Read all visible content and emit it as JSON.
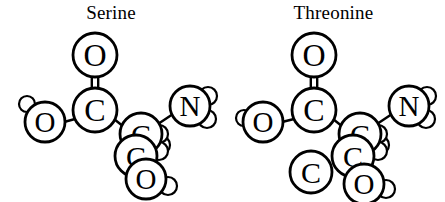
{
  "figure": {
    "background_color": "#ffffff",
    "stroke_color": "#000000",
    "fill_color": "#ffffff",
    "width": 445,
    "height": 202
  },
  "molecules": [
    {
      "id": "serine",
      "title": "Serine",
      "atoms": [
        {
          "name": "carbonyl-oxygen",
          "label": "O",
          "cx": 95,
          "cy": 55,
          "r": 22,
          "size": "large"
        },
        {
          "name": "carboxyl-carbon",
          "label": "C",
          "cx": 95,
          "cy": 110,
          "r": 22,
          "size": "large"
        },
        {
          "name": "hydroxyl-oxygen",
          "label": "O",
          "cx": 45,
          "cy": 122,
          "r": 20,
          "size": "large"
        },
        {
          "name": "hydroxyl-hydrogen",
          "label": "",
          "cx": 27,
          "cy": 104,
          "r": 8,
          "size": "small"
        },
        {
          "name": "alpha-carbon",
          "label": "C",
          "cx": 141,
          "cy": 134,
          "r": 21,
          "size": "large"
        },
        {
          "name": "alpha-hydrogen",
          "label": "",
          "cx": 161,
          "cy": 145,
          "r": 9,
          "size": "small"
        },
        {
          "name": "amine-nitrogen",
          "label": "N",
          "cx": 190,
          "cy": 106,
          "r": 20,
          "size": "large"
        },
        {
          "name": "amine-hydrogen-upper",
          "label": "",
          "cx": 208,
          "cy": 96,
          "r": 9,
          "size": "small"
        },
        {
          "name": "amine-hydrogen-lower",
          "label": "",
          "cx": 207,
          "cy": 119,
          "r": 9,
          "size": "small"
        },
        {
          "name": "beta-carbon",
          "label": "C",
          "cx": 136,
          "cy": 156,
          "r": 21,
          "size": "large"
        },
        {
          "name": "beta-hydrogen-upper",
          "label": "",
          "cx": 159,
          "cy": 134,
          "r": 9,
          "size": "small"
        },
        {
          "name": "beta-hydrogen-lower",
          "label": "",
          "cx": 159,
          "cy": 151,
          "r": 9,
          "size": "small"
        },
        {
          "name": "side-hydroxyl-oxygen",
          "label": "O",
          "cx": 146,
          "cy": 179,
          "r": 20,
          "size": "large"
        },
        {
          "name": "side-hydroxyl-hydrogen",
          "label": "",
          "cx": 168,
          "cy": 186,
          "r": 9,
          "size": "small"
        }
      ],
      "bonds": [
        {
          "name": "carbonyl-double-bond",
          "type": "double",
          "x1": 95,
          "y1": 77,
          "x2": 95,
          "y2": 88
        },
        {
          "name": "carboxyl-hydroxyl-bond",
          "type": "single",
          "x1": 75,
          "y1": 119,
          "x2": 64,
          "y2": 122
        },
        {
          "name": "carboxyl-alpha-bond",
          "type": "single",
          "x1": 114,
          "y1": 119,
          "x2": 124,
          "y2": 127
        },
        {
          "name": "alpha-amine-bond",
          "type": "single",
          "x1": 158,
          "y1": 124,
          "x2": 173,
          "y2": 114
        }
      ]
    },
    {
      "id": "threonine",
      "title": "Threonine",
      "atoms": [
        {
          "name": "carbonyl-oxygen",
          "label": "O",
          "cx": 92,
          "cy": 55,
          "r": 22,
          "size": "large"
        },
        {
          "name": "carboxyl-carbon",
          "label": "C",
          "cx": 92,
          "cy": 110,
          "r": 22,
          "size": "large"
        },
        {
          "name": "hydroxyl-oxygen",
          "label": "O",
          "cx": 41,
          "cy": 122,
          "r": 20,
          "size": "large"
        },
        {
          "name": "hydroxyl-hydrogen",
          "label": "",
          "cx": 22,
          "cy": 118,
          "r": 8,
          "size": "small"
        },
        {
          "name": "alpha-carbon",
          "label": "C",
          "cx": 138,
          "cy": 134,
          "r": 21,
          "size": "large"
        },
        {
          "name": "alpha-hydrogen",
          "label": "",
          "cx": 158,
          "cy": 145,
          "r": 9,
          "size": "small"
        },
        {
          "name": "amine-nitrogen",
          "label": "N",
          "cx": 187,
          "cy": 106,
          "r": 20,
          "size": "large"
        },
        {
          "name": "amine-hydrogen-upper",
          "label": "",
          "cx": 205,
          "cy": 96,
          "r": 9,
          "size": "small"
        },
        {
          "name": "amine-hydrogen-lower",
          "label": "",
          "cx": 204,
          "cy": 119,
          "r": 9,
          "size": "small"
        },
        {
          "name": "beta-carbon",
          "label": "C",
          "cx": 131,
          "cy": 156,
          "r": 21,
          "size": "large"
        },
        {
          "name": "beta-hydrogen-upper",
          "label": "",
          "cx": 156,
          "cy": 134,
          "r": 9,
          "size": "small"
        },
        {
          "name": "beta-hydrogen-lower",
          "label": "",
          "cx": 156,
          "cy": 151,
          "r": 9,
          "size": "small"
        },
        {
          "name": "methyl-carbon",
          "label": "C",
          "cx": 89,
          "cy": 172,
          "r": 21,
          "size": "large"
        },
        {
          "name": "side-hydroxyl-oxygen",
          "label": "O",
          "cx": 142,
          "cy": 184,
          "r": 20,
          "size": "large"
        },
        {
          "name": "side-hydroxyl-hydrogen",
          "label": "",
          "cx": 164,
          "cy": 189,
          "r": 9,
          "size": "small"
        }
      ],
      "bonds": [
        {
          "name": "carbonyl-double-bond",
          "type": "double",
          "x1": 92,
          "y1": 77,
          "x2": 92,
          "y2": 88
        },
        {
          "name": "carboxyl-hydroxyl-bond",
          "type": "single",
          "x1": 72,
          "y1": 119,
          "x2": 60,
          "y2": 122
        },
        {
          "name": "carboxyl-alpha-bond",
          "type": "single",
          "x1": 111,
          "y1": 119,
          "x2": 121,
          "y2": 127
        },
        {
          "name": "alpha-amine-bond",
          "type": "single",
          "x1": 155,
          "y1": 124,
          "x2": 170,
          "y2": 114
        }
      ]
    }
  ]
}
